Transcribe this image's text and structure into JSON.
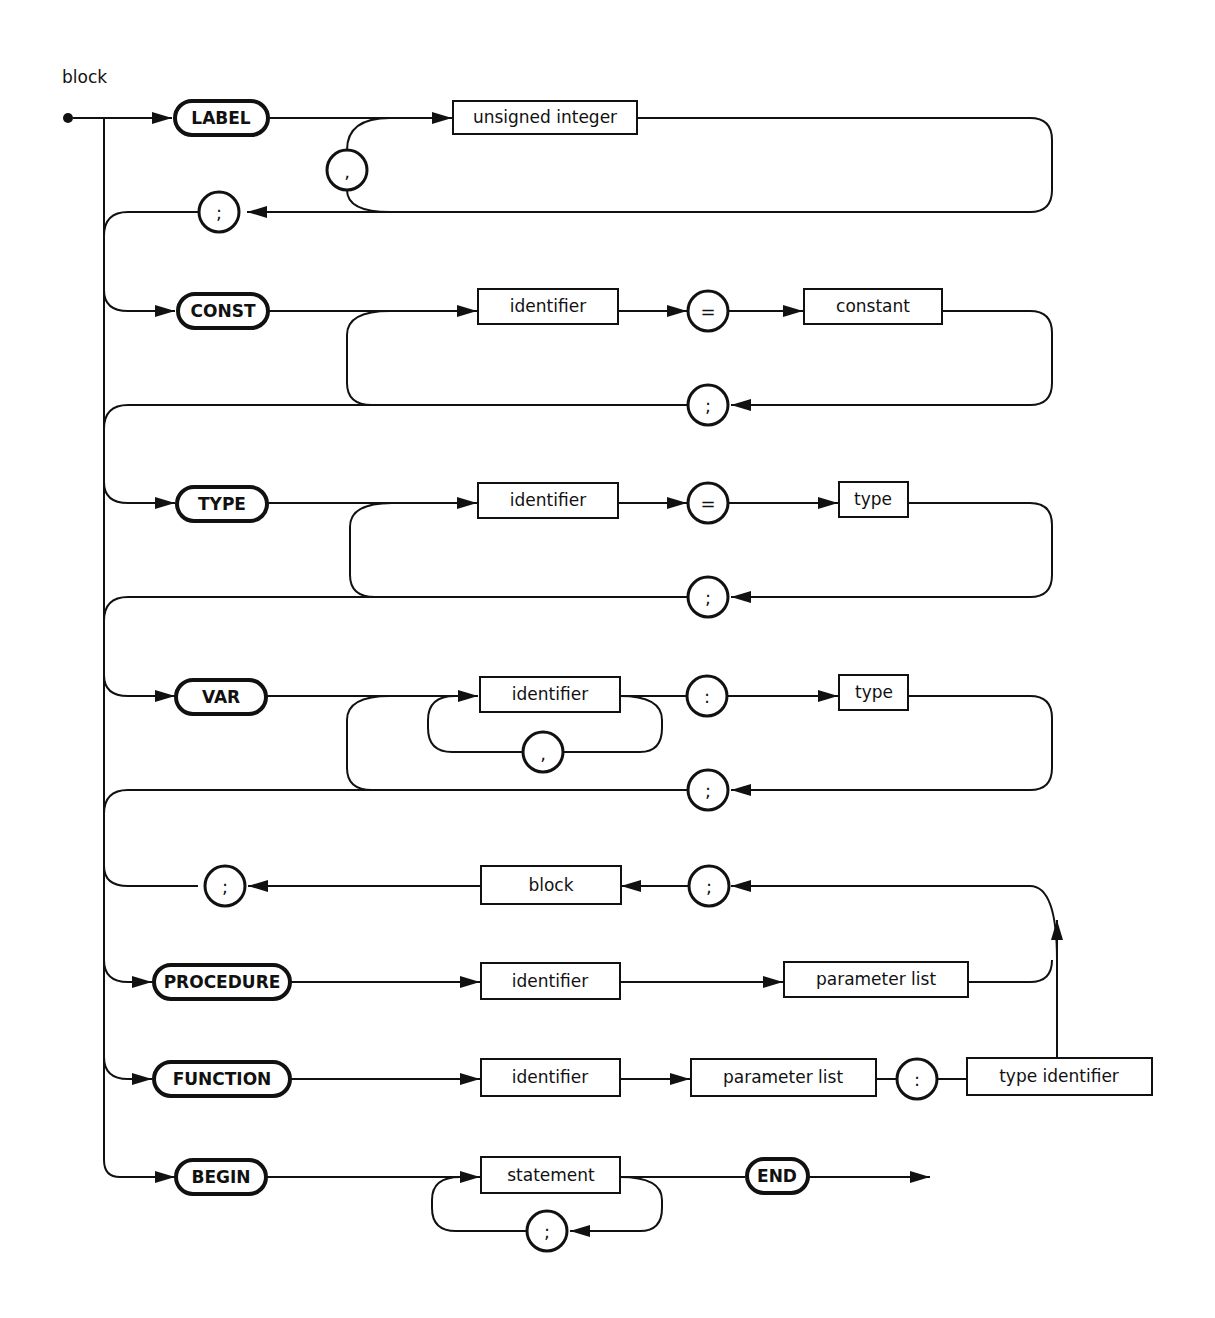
{
  "diagram": {
    "title": "block",
    "rules": {
      "label": {
        "keyword": "LABEL",
        "item": "unsigned integer",
        "separator": ",",
        "terminator": ";"
      },
      "const": {
        "keyword": "CONST",
        "name": "identifier",
        "equals": "=",
        "value": "constant",
        "terminator": ";"
      },
      "type": {
        "keyword": "TYPE",
        "name": "identifier",
        "equals": "=",
        "value": "type",
        "terminator": ";"
      },
      "var": {
        "keyword": "VAR",
        "name": "identifier",
        "separator": ",",
        "colon": ":",
        "value": "type",
        "terminator": ";"
      },
      "subprogram": {
        "block": "block",
        "semicolon_before_block": ";",
        "semicolon_after_block": ";"
      },
      "procedure": {
        "keyword": "PROCEDURE",
        "name": "identifier",
        "params": "parameter list"
      },
      "function": {
        "keyword": "FUNCTION",
        "name": "identifier",
        "params": "parameter list",
        "colon": ":",
        "result": "type identifier"
      },
      "begin": {
        "keyword": "BEGIN",
        "item": "statement",
        "separator": ";",
        "end_keyword": "END"
      }
    }
  }
}
